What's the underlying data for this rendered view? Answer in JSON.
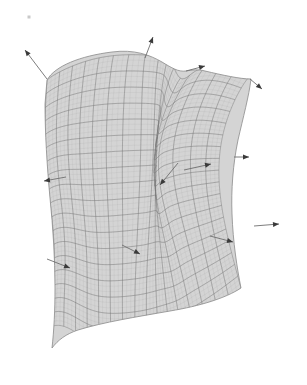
{
  "figure": {
    "background_color": "#ffffff",
    "width": 307,
    "height": 385
  },
  "surface": {
    "name": "deformed-quadrilateral-patch",
    "fill_color": "#d2d2d2",
    "fill_opacity": 0.95,
    "outline_color": "#8a8a8a",
    "outline_width": 0.8,
    "grid_color": "#7c7c7c",
    "grid_width": 0.55,
    "grid_rows": 18,
    "grid_cols": 16,
    "description": "Saddle-shaped mapped mesh patch, concave notch on the upper edge and a downward cusp at the lower-left corner",
    "boundary_path": "M 47,80 C 55,66 80,56 112,52 C 134,49 150,55 162,62 C 172,68 178,72 186,71 C 192,70 198,69 205,71 C 222,75 240,79 251,79 C 249,96 243,118 238,140 C 233,164 231,190 232,214 C 233,242 237,268 241,288 C 226,298 200,306 170,311 C 136,317 104,322 78,330 C 66,334 58,340 52,348 C 54,330 55,310 55,288 C 55,258 53,228 50,198 C 47,166 45,132 45,104 Z"
  },
  "chart_data": {
    "type": "scatter",
    "xlabel": "",
    "ylabel": "",
    "grid": true,
    "legend": null,
    "vector_count": 10,
    "vectors": [
      {
        "id": "n1",
        "label": "normal-upper-left",
        "origin": [
          47,
          79
        ],
        "tip": [
          25,
          50
        ],
        "location": "upper-left-edge"
      },
      {
        "id": "n2",
        "label": "normal-top",
        "origin": [
          145,
          58
        ],
        "tip": [
          153,
          37
        ],
        "location": "top-edge"
      },
      {
        "id": "n3",
        "label": "normal-notch",
        "origin": [
          186,
          71
        ],
        "tip": [
          205,
          66
        ],
        "location": "top-notch"
      },
      {
        "id": "n4",
        "label": "normal-upper-right",
        "origin": [
          250,
          79
        ],
        "tip": [
          262,
          89
        ],
        "location": "upper-right-corner"
      },
      {
        "id": "n5",
        "label": "normal-right",
        "origin": [
          234,
          157
        ],
        "tip": [
          249,
          157
        ],
        "location": "right-edge"
      },
      {
        "id": "n6",
        "label": "normal-left",
        "origin": [
          66,
          177
        ],
        "tip": [
          44,
          181
        ],
        "location": "left-edge"
      },
      {
        "id": "n7",
        "label": "normal-lower-right",
        "origin": [
          254,
          226
        ],
        "tip": [
          279,
          224
        ],
        "location": "right-edge-lower"
      },
      {
        "id": "n8",
        "label": "normal-interior-a",
        "origin": [
          184,
          170
        ],
        "tip": [
          211,
          164
        ],
        "location": "interior"
      },
      {
        "id": "n9",
        "label": "normal-interior-b",
        "origin": [
          178,
          163
        ],
        "tip": [
          160,
          185
        ],
        "location": "interior"
      },
      {
        "id": "n10",
        "label": "normal-interior-c",
        "origin": [
          210,
          236
        ],
        "tip": [
          233,
          242
        ],
        "location": "interior"
      },
      {
        "id": "n11",
        "label": "normal-interior-d",
        "origin": [
          122,
          245
        ],
        "tip": [
          140,
          254
        ],
        "location": "interior"
      },
      {
        "id": "n12",
        "label": "normal-interior-e",
        "origin": [
          47,
          259
        ],
        "tip": [
          70,
          268
        ],
        "location": "interior-lower-left"
      }
    ],
    "arrow_style": {
      "line_color": "#6e6e6e",
      "line_width": 0.9,
      "head_color": "#3a3a3a",
      "head_length": 6,
      "head_width": 5
    }
  },
  "marks": {
    "corner_speck": {
      "label": "faint-gray-speck",
      "x": 29,
      "y": 17,
      "size": 3,
      "color": "#c9c9c9"
    }
  }
}
